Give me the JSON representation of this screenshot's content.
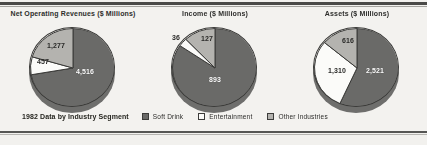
{
  "figure": {
    "caption": "1982 Data by Industry Segment"
  },
  "legend": {
    "items": [
      {
        "label": "Soft Drink",
        "swatch": "dark",
        "color": "#6a6a68"
      },
      {
        "label": "Entertainment",
        "swatch": "white",
        "color": "#fbfbf9"
      },
      {
        "label": "Other Industries",
        "swatch": "light",
        "color": "#b4b3af"
      }
    ]
  },
  "chart_data": [
    {
      "type": "pie",
      "title": "Net Operating Revenues ($ Millions)",
      "categories": [
        "Soft Drink",
        "Entertainment",
        "Other Industries"
      ],
      "values": [
        4516,
        457,
        1277
      ],
      "labels": [
        "4,516",
        "457",
        "1,277"
      ],
      "colors": [
        "#6a6a68",
        "#fbfbf9",
        "#b4b3af"
      ],
      "units": "$ Millions",
      "legend_position": "bottom-shared"
    },
    {
      "type": "pie",
      "title": "Income ($ Millions)",
      "categories": [
        "Soft Drink",
        "Entertainment",
        "Other Industries"
      ],
      "values": [
        893,
        36,
        127
      ],
      "labels": [
        "893",
        "36",
        "127"
      ],
      "colors": [
        "#6a6a68",
        "#fbfbf9",
        "#b4b3af"
      ],
      "units": "$ Millions",
      "legend_position": "bottom-shared"
    },
    {
      "type": "pie",
      "title": "Assets ($ Millions)",
      "categories": [
        "Soft Drink",
        "Entertainment",
        "Other Industries"
      ],
      "values": [
        2521,
        1310,
        616
      ],
      "labels": [
        "2,521",
        "1,310",
        "616"
      ],
      "colors": [
        "#6a6a68",
        "#fbfbf9",
        "#b4b3af"
      ],
      "units": "$ Millions",
      "legend_position": "bottom-shared"
    }
  ]
}
